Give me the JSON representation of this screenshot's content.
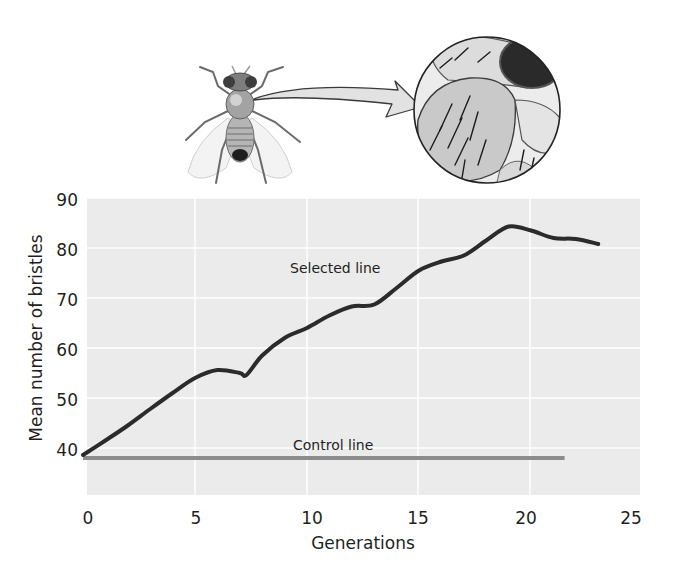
{
  "chart_data": {
    "type": "line",
    "title": "",
    "xlabel": "Generations",
    "ylabel": "Mean number of bristles",
    "xlim": [
      0,
      25
    ],
    "ylim": [
      33,
      90
    ],
    "x_ticks": [
      "0",
      "5",
      "10",
      "15",
      "20",
      "25"
    ],
    "y_ticks": [
      "40",
      "50",
      "60",
      "70",
      "80",
      "90"
    ],
    "grid": true,
    "legend": "inline labels",
    "annotations": [
      "Selected line",
      "Control line"
    ],
    "series": [
      {
        "name": "Selected line",
        "color": "#2b2b2b",
        "x": [
          0,
          1,
          2,
          3,
          4,
          5,
          6,
          7,
          7.3,
          8,
          9,
          10,
          11,
          12,
          13,
          14,
          15,
          16,
          17,
          18,
          19,
          20,
          21,
          22,
          23
        ],
        "values": [
          38.6,
          41.5,
          44.5,
          47.8,
          51,
          54,
          55.6,
          55,
          54.6,
          58.5,
          62,
          64,
          66.5,
          68.3,
          68.7,
          72,
          75.5,
          77.3,
          78.5,
          81.5,
          84.3,
          83.5,
          82,
          81.8,
          80.8
        ]
      },
      {
        "name": "Control line",
        "color": "#8c8c8c",
        "x": [
          0,
          21.5
        ],
        "values": [
          38,
          38
        ]
      }
    ]
  },
  "labels": {
    "x_axis_title": "Generations",
    "y_axis_title": "Mean number of bristles",
    "selected_line": "Selected line",
    "control_line": "Control line",
    "x_ticks": [
      "0",
      "5",
      "10",
      "15",
      "20",
      "25"
    ],
    "y_ticks": [
      "90",
      "80",
      "70",
      "60",
      "50",
      "40"
    ]
  },
  "illustration": {
    "subject": "fruit-fly",
    "inset": "magnified-thorax-bristles",
    "connector": "curved-arrow"
  },
  "colors": {
    "plot_background": "#ebebeb",
    "gridline": "#ffffff",
    "selected_line": "#2b2b2b",
    "control_line": "#8c8c8c"
  }
}
